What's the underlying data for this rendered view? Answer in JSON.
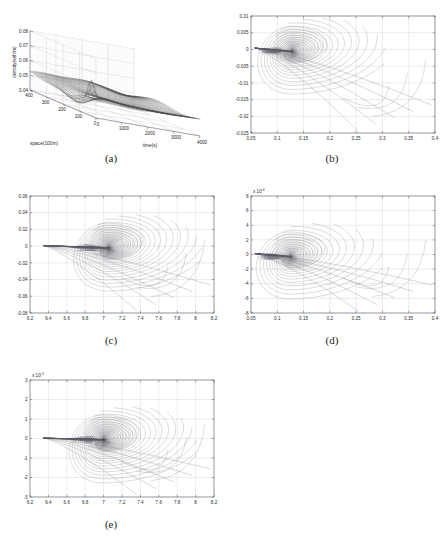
{
  "figure": {
    "panels": [
      {
        "id": "a",
        "caption": "(a)",
        "type": "surface3d",
        "zlabel": "density(veh/m)",
        "xlabel": "space(100m)",
        "ylabel": "time(s)",
        "zticks": [
          "0.08",
          "0.07",
          "0.06",
          "0.05",
          "0.04"
        ],
        "zvals": [
          0.08,
          0.07,
          0.06,
          0.05,
          0.04
        ],
        "xticks": [
          "400",
          "300",
          "200",
          "100",
          "0"
        ],
        "xvals": [
          400,
          300,
          200,
          100,
          0
        ],
        "yticks": [
          "0",
          "1000",
          "2000",
          "3000",
          "4000"
        ],
        "yvals": [
          0,
          1000,
          2000,
          3000,
          4000
        ],
        "zlim": [
          0.04,
          0.08
        ],
        "xlim": [
          0,
          400
        ],
        "ylim": [
          0,
          4000
        ],
        "base_density": 0.05,
        "peak_density": 0.063,
        "mesh_color": "#4d4d4d"
      },
      {
        "id": "b",
        "caption": "(b)",
        "type": "phase_portrait",
        "xticks": [
          "0.05",
          "0.1",
          "0.15",
          "0.2",
          "0.25",
          "0.3",
          "0.35",
          "0.4"
        ],
        "xvals": [
          0.05,
          0.1,
          0.15,
          0.2,
          0.25,
          0.3,
          0.35,
          0.4
        ],
        "yticks": [
          "0.01",
          "0.005",
          "0",
          "-0.005",
          "-0.01",
          "-0.015",
          "-0.02",
          "-0.025"
        ],
        "yvals": [
          0.01,
          0.005,
          0,
          -0.005,
          -0.01,
          -0.015,
          -0.02,
          -0.025
        ],
        "xlim": [
          0.05,
          0.4
        ],
        "ylim": [
          -0.025,
          0.01
        ],
        "exponent": "",
        "focus": [
          0.128,
          -0.0005
        ],
        "entry": [
          0.058,
          0.0004
        ],
        "n_curves": 26,
        "curve_color": "#5a5a64"
      },
      {
        "id": "c",
        "caption": "(c)",
        "type": "phase_portrait",
        "xticks": [
          "6.2",
          "6.4",
          "6.6",
          "6.8",
          "7",
          "7.2",
          "7.4",
          "7.6",
          "7.8",
          "8",
          "8.2"
        ],
        "xvals": [
          6.2,
          6.4,
          6.6,
          6.8,
          7,
          7.2,
          7.4,
          7.6,
          7.8,
          8,
          8.2
        ],
        "yticks": [
          "0.06",
          "0.04",
          "0.02",
          "0",
          "-0.02",
          "-0.04",
          "-0.06",
          "-0.08"
        ],
        "yvals": [
          0.06,
          0.04,
          0.02,
          0,
          -0.02,
          -0.04,
          -0.06,
          -0.08
        ],
        "xlim": [
          6.2,
          8.2
        ],
        "ylim": [
          -0.08,
          0.06
        ],
        "exponent": "",
        "focus": [
          7.05,
          -0.002
        ],
        "entry": [
          6.35,
          0.0006
        ],
        "n_curves": 30,
        "curve_color": "#5a5a64"
      },
      {
        "id": "d",
        "caption": "(d)",
        "type": "phase_portrait",
        "xticks": [
          "0.05",
          "0.1",
          "0.15",
          "0.2",
          "0.25",
          "0.3",
          "0.35",
          "0.4"
        ],
        "xvals": [
          0.05,
          0.1,
          0.15,
          0.2,
          0.25,
          0.3,
          0.35,
          0.4
        ],
        "yticks": [
          "8",
          "6",
          "4",
          "2",
          "0",
          "-2",
          "-4",
          "-6",
          "-8"
        ],
        "yvals": [
          8,
          6,
          4,
          2,
          0,
          -2,
          -4,
          -6,
          -8
        ],
        "xlim": [
          0.05,
          0.4
        ],
        "ylim": [
          -8,
          8
        ],
        "exponent": "x 10",
        "exponent_sup": "-4",
        "focus": [
          0.125,
          -0.25
        ],
        "entry": [
          0.058,
          0.12
        ],
        "n_curves": 24,
        "curve_color": "#5a5a64"
      },
      {
        "id": "e",
        "caption": "(e)",
        "type": "phase_portrait",
        "xticks": [
          "6.2",
          "6.4",
          "6.6",
          "6.8",
          "7",
          "7.2",
          "7.4",
          "7.6",
          "7.8",
          "8",
          "8.2"
        ],
        "xvals": [
          6.2,
          6.4,
          6.6,
          6.8,
          7,
          7.2,
          7.4,
          7.6,
          7.8,
          8,
          8.2
        ],
        "yticks": [
          "3",
          "2",
          "1",
          "0",
          "-1",
          "-2",
          "-3"
        ],
        "yvals": [
          3,
          2,
          1,
          0,
          -1,
          -2,
          -3
        ],
        "xlim": [
          6.2,
          8.2
        ],
        "ylim": [
          -3,
          3
        ],
        "exponent": "x 10",
        "exponent_sup": "-3",
        "focus": [
          7.0,
          -0.06
        ],
        "entry": [
          6.35,
          0.02
        ],
        "n_curves": 30,
        "curve_color": "#5a5a64"
      }
    ]
  }
}
